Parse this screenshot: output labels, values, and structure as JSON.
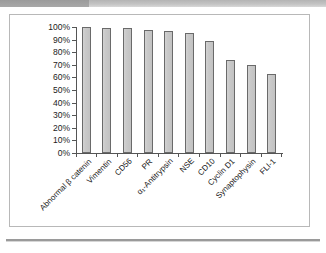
{
  "header": {
    "title": "",
    "tab_label": ""
  },
  "chart_data": {
    "type": "bar",
    "title": "",
    "xlabel": "",
    "ylabel": "",
    "ylim": [
      0,
      100
    ],
    "grid": false,
    "legend": "none",
    "categories": [
      "Abnormal β catenin",
      "Vimentin",
      "CD56",
      "PR",
      "α₁-Antitrypsin",
      "NSE",
      "CD10",
      "Cyclin D1",
      "Synaptophysin",
      "FLI-1"
    ],
    "values": [
      100,
      99,
      99,
      98,
      97,
      95,
      89,
      74,
      70,
      63
    ],
    "yticks": [
      "0%",
      "10%",
      "20%",
      "30%",
      "40%",
      "50%",
      "60%",
      "70%",
      "80%",
      "90%",
      "100%"
    ],
    "ytick_values": [
      0,
      10,
      20,
      30,
      40,
      50,
      60,
      70,
      80,
      90,
      100
    ],
    "bar_fill_color": "#c9c9c9",
    "bar_border_color": "#6a6a6a",
    "axis_color": "#555555",
    "plot_background": "#ffffff"
  }
}
